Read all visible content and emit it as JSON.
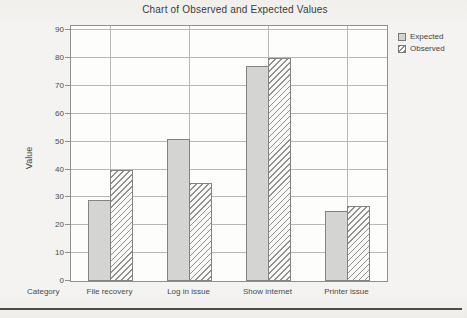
{
  "chart_data": {
    "type": "bar",
    "title": "Chart of Observed and Expected Values",
    "xlabel": "Category",
    "ylabel": "Value",
    "ylim": [
      0,
      90
    ],
    "ytick_step": 10,
    "grid": true,
    "legend_position": "top-right",
    "categories": [
      "File recovery",
      "Log in issue",
      "Show internet",
      "Printer issue"
    ],
    "series": [
      {
        "name": "Expected",
        "style": "solid",
        "fill_color": "#d4d4d2",
        "values": [
          29,
          51,
          77,
          25
        ]
      },
      {
        "name": "Observed",
        "style": "hatched",
        "hatch_color": "#919191",
        "values": [
          40,
          35,
          80,
          27
        ]
      }
    ]
  },
  "colors": {
    "plot_background": "#fdfdfc",
    "grid_line": "#b8b8b6",
    "box_border": "#8f8f8f",
    "text": "#3d3d3d",
    "bottom_rule": "#4c4c4c"
  }
}
